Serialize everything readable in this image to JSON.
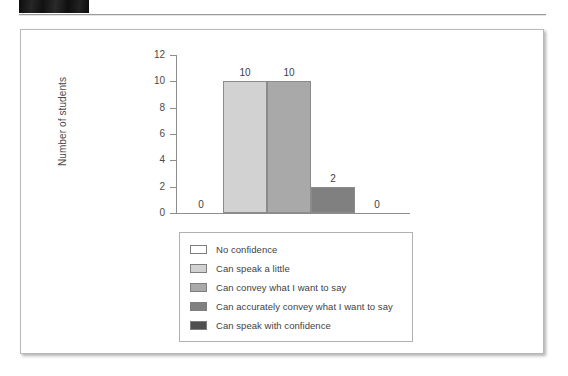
{
  "header": {
    "redaction_label": "",
    "rule": "horizontal-rule"
  },
  "chart_data": {
    "type": "bar",
    "title": "",
    "xlabel": "",
    "ylabel": "Number of students",
    "categories": [
      "No confidence",
      "Can speak a little",
      "Can convey what I want to say",
      "Can accurately convey what I want to say",
      "Can speak with confidence"
    ],
    "values": [
      0,
      10,
      10,
      2,
      0
    ],
    "value_labels": [
      "0",
      "10",
      "10",
      "2",
      "0"
    ],
    "ylim": [
      0,
      12
    ],
    "yticks": [
      0,
      2,
      4,
      6,
      8,
      10,
      12
    ],
    "ytick_labels": [
      "0",
      "2",
      "4",
      "6",
      "8",
      "10",
      "12"
    ],
    "grid": false,
    "legend_position": "below-plot",
    "bar_colors": [
      "#ffffff",
      "#d2d2d2",
      "#a9a9a9",
      "#808080",
      "#4f4f4f"
    ],
    "bar_border_color": "#8b8b8b",
    "axis_color": "#8d8d8d",
    "text_color": "#4b4b4b"
  },
  "legend": {
    "items": [
      {
        "label": "No confidence",
        "color": "#ffffff"
      },
      {
        "label": "Can speak a little",
        "color": "#d2d2d2"
      },
      {
        "label": "Can convey what I want to say",
        "color": "#a9a9a9"
      },
      {
        "label": "Can accurately convey what I want to say",
        "color": "#808080"
      },
      {
        "label": "Can speak with confidence",
        "color": "#4f4f4f"
      }
    ]
  }
}
